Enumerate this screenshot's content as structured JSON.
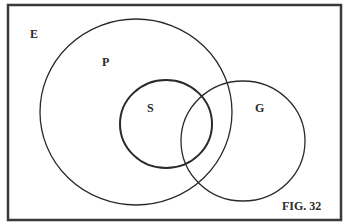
{
  "figure": {
    "caption": "FIG. 32",
    "universe_label": "E",
    "sets": [
      {
        "label": "P",
        "cx": 136,
        "cy": 112,
        "rx": 96,
        "ry": 93
      },
      {
        "label": "S",
        "cx": 166,
        "cy": 124,
        "rx": 46,
        "ry": 44
      },
      {
        "label": "G",
        "cx": 243,
        "cy": 141,
        "rx": 62,
        "ry": 60
      }
    ]
  },
  "colors": {
    "stroke": "#2a2a2a",
    "background": "#ffffff"
  }
}
